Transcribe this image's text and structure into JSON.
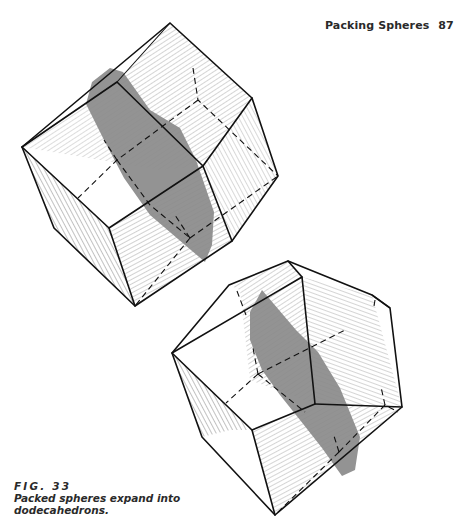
{
  "header": {
    "title": "Packing Spheres",
    "page_number": "87"
  },
  "figure": {
    "label": "FIG. 33",
    "caption_line1": "Packed spheres expand into",
    "caption_line2": "dodecahedrons.",
    "subjects": [
      "top-rhombic-dodecahedron",
      "bottom-rhombic-dodecahedron"
    ],
    "colors": {
      "edge": "#111111",
      "plane_shade": "#8a8a8a",
      "background": "#ffffff"
    }
  }
}
